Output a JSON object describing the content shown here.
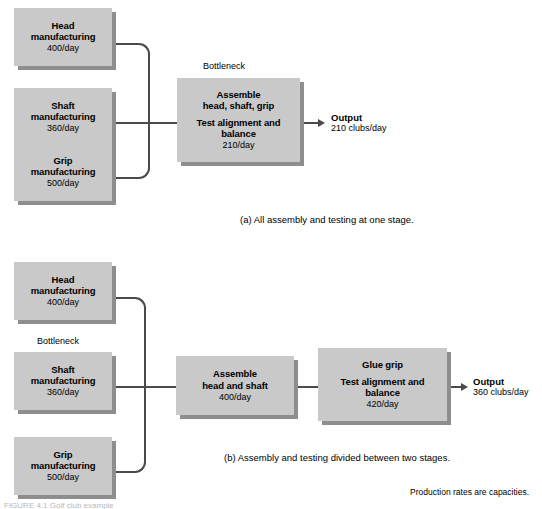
{
  "figure": {
    "footnote": "Production rates are capacities.",
    "credit": "FIGURE 4.1   Golf club example"
  },
  "diagram_a": {
    "caption": "(a) All assembly and testing at one stage.",
    "bottleneck_label": "Bottleneck",
    "inputs": [
      {
        "name": "head-manufacturing",
        "line1": "Head",
        "line2": "manufacturing",
        "rate": "400/day"
      },
      {
        "name": "shaft-manufacturing",
        "line1": "Shaft",
        "line2": "manufacturing",
        "rate": "360/day"
      },
      {
        "name": "grip-manufacturing",
        "line1": "Grip",
        "line2": "manufacturing",
        "rate": "500/day"
      }
    ],
    "stage": {
      "name": "assemble-test-stage",
      "line1": "Assemble",
      "line2": "head, shaft, grip",
      "line3": "Test alignment and",
      "line4": "balance",
      "rate": "210/day"
    },
    "output": {
      "title": "Output",
      "value": "210 clubs/day"
    }
  },
  "diagram_b": {
    "caption": "(b) Assembly and testing divided between two stages.",
    "bottleneck_label": "Bottleneck",
    "inputs": [
      {
        "name": "head-manufacturing",
        "line1": "Head",
        "line2": "manufacturing",
        "rate": "400/day"
      },
      {
        "name": "shaft-manufacturing",
        "line1": "Shaft",
        "line2": "manufacturing",
        "rate": "360/day"
      },
      {
        "name": "grip-manufacturing",
        "line1": "Grip",
        "line2": "manufacturing",
        "rate": "500/day"
      }
    ],
    "stage1": {
      "name": "assemble-head-shaft-stage",
      "line1": "Assemble",
      "line2": "head and shaft",
      "rate": "400/day"
    },
    "stage2": {
      "name": "glue-grip-test-stage",
      "line1": "Glue grip",
      "line2": "Test alignment and",
      "line3": "balance",
      "rate": "420/day"
    },
    "output": {
      "title": "Output",
      "value": "360 clubs/day"
    }
  },
  "colors": {
    "box_fill": "#c9c9c9",
    "box_shadow": "#8e8e8e",
    "line": "#4a4a4a",
    "background": "#ffffff"
  }
}
